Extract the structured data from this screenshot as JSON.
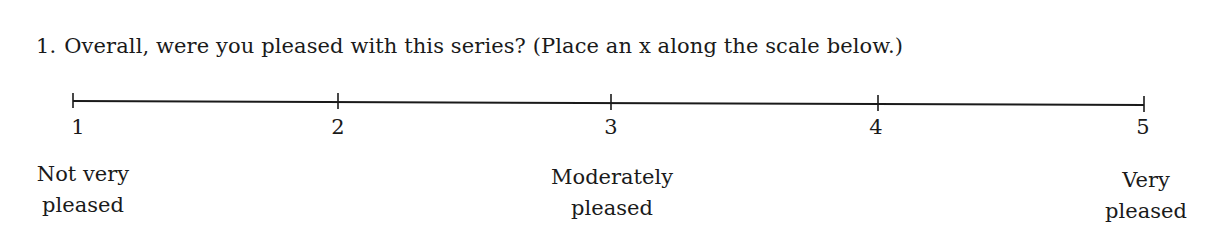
{
  "question": {
    "number": "1.",
    "text": "Overall, were you pleased with this series? (Place an x along the scale below.)"
  },
  "scale": {
    "min": 1,
    "max": 5,
    "ticks": [
      "1",
      "2",
      "3",
      "4",
      "5"
    ],
    "anchors": [
      {
        "at": 1,
        "line1": "Not very",
        "line2": "pleased"
      },
      {
        "at": 3,
        "line1": "Moderately",
        "line2": "pleased"
      },
      {
        "at": 5,
        "line1": "Very",
        "line2": "pleased"
      }
    ]
  }
}
